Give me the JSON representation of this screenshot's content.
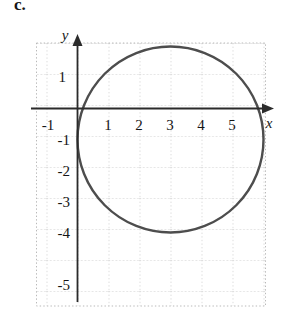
{
  "figure": {
    "part_label": "c.",
    "background_color": "#ffffff"
  },
  "axes": {
    "x_axis_name": "x",
    "y_axis_name": "y",
    "axis_color": "#2b2b2b",
    "grid_color": "#b9b9b9",
    "x_tick_labels": [
      "-1",
      "1",
      "2",
      "3",
      "4",
      "5"
    ],
    "y_tick_labels": [
      "1",
      "-1",
      "-2",
      "-3",
      "-4",
      "-5"
    ]
  },
  "chart_data": {
    "type": "scatter",
    "title": "",
    "xlabel": "x",
    "ylabel": "y",
    "xlim": [
      -1.3,
      6.1
    ],
    "ylim": [
      -5.8,
      2.4
    ],
    "grid": true,
    "legend": "none",
    "x_ticks": [
      -1,
      1,
      2,
      3,
      4,
      5
    ],
    "y_ticks": [
      1,
      -1,
      -2,
      -3,
      -4,
      -5
    ],
    "annotations": [
      "c."
    ],
    "series": [
      {
        "name": "circle",
        "shape": "circle",
        "center": [
          3,
          -1
        ],
        "radius": 3,
        "equation": "(x - 3)^2 + (y + 1)^2 = 9",
        "color": "#4d4d4d",
        "line_width": 2.4,
        "x_intercepts": [
          0,
          6
        ],
        "top_point": [
          3,
          2
        ],
        "bottom_point": [
          3,
          -4
        ]
      }
    ]
  }
}
